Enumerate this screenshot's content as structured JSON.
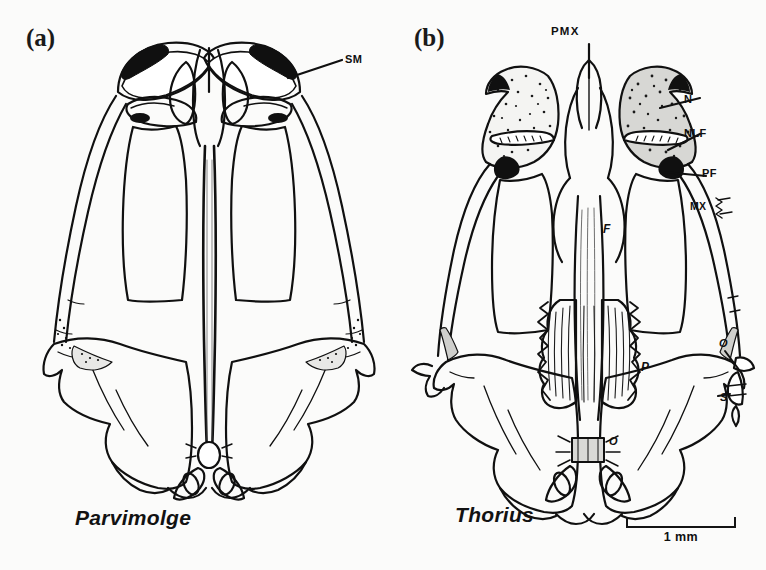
{
  "figure": {
    "type": "comparative-anatomical-line-drawing",
    "background_color": "#fbfbfa",
    "ink_color": "#101010"
  },
  "panels": [
    {
      "id": "a",
      "label": "(a)",
      "species": "Parvimolge",
      "annotations": [
        {
          "key": "SM",
          "text": "SM",
          "meaning": "septomaxilla",
          "leader": true
        }
      ]
    },
    {
      "id": "b",
      "label": "(b)",
      "species": "Thorius",
      "annotations": [
        {
          "key": "PMX",
          "text": "PMX",
          "meaning": "premaxilla",
          "leader": true
        },
        {
          "key": "N",
          "text": "N",
          "meaning": "nasal",
          "leader": true
        },
        {
          "key": "NLF",
          "text": "NLF",
          "meaning": "nasolacrimal foramen",
          "leader": true
        },
        {
          "key": "PF",
          "text": "PF",
          "meaning": "prefrontal",
          "leader": true
        },
        {
          "key": "MX",
          "text": "MX",
          "meaning": "maxilla",
          "leader": false
        },
        {
          "key": "F",
          "text": "F",
          "meaning": "frontal",
          "leader": false
        },
        {
          "key": "P",
          "text": "P",
          "meaning": "parietal",
          "leader": false
        },
        {
          "key": "O",
          "text": "O",
          "meaning": "otic-occipital",
          "leader": false
        },
        {
          "key": "O2",
          "text": "O",
          "meaning": "operculum",
          "leader": true
        },
        {
          "key": "S",
          "text": "S",
          "meaning": "stapes",
          "leader": true
        }
      ]
    }
  ],
  "scalebar": {
    "label": "1 mm",
    "length_mm": 1
  }
}
